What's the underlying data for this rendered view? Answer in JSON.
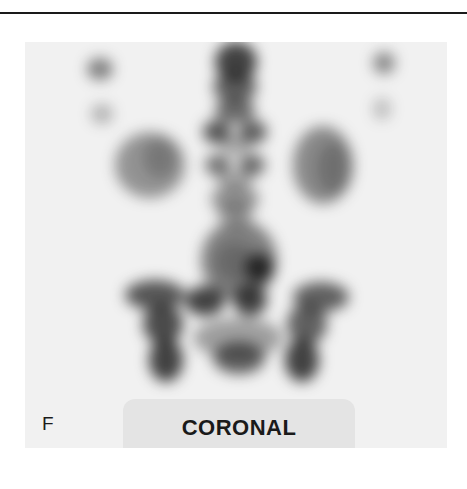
{
  "figure": {
    "panel_letter": "F",
    "view_label": "CORONAL",
    "image_description": "Grayscale nuclear medicine bone scan, coronal view of lower spine and pelvis",
    "colors": {
      "background": "#ffffff",
      "panel_background": "#f1f1f1",
      "label_box": "#e4e4e4",
      "uptake_dark": "#222222",
      "rule": "#1a1a1a"
    }
  }
}
